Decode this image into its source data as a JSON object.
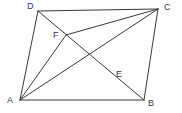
{
  "figure": {
    "background_color": "#fdfdfd",
    "stroke_color": "#3a3a3a",
    "stroke_width": 1,
    "width": 182,
    "height": 113,
    "labels": {
      "A": "A",
      "B": "B",
      "C": "C",
      "D": "D",
      "E": "E",
      "F": "F"
    },
    "points": {
      "A": {
        "x": 20,
        "y": 100
      },
      "B": {
        "x": 144,
        "y": 100
      },
      "C": {
        "x": 158,
        "y": 9
      },
      "D": {
        "x": 38,
        "y": 11
      },
      "E": {
        "x": 112,
        "y": 76
      },
      "F": {
        "x": 66,
        "y": 35
      }
    },
    "label_positions": {
      "A": {
        "x": 7,
        "y": 96
      },
      "B": {
        "x": 148,
        "y": 99
      },
      "C": {
        "x": 164,
        "y": 3
      },
      "D": {
        "x": 27,
        "y": 2
      },
      "E": {
        "x": 116,
        "y": 70
      },
      "F": {
        "x": 53,
        "y": 31
      }
    },
    "segments": [
      {
        "name": "side-AB",
        "from": "A",
        "to": "B"
      },
      {
        "name": "side-BC",
        "from": "B",
        "to": "C"
      },
      {
        "name": "side-CD",
        "from": "C",
        "to": "D"
      },
      {
        "name": "side-DA",
        "from": "D",
        "to": "A"
      },
      {
        "name": "diagonal-DB-through-F-and-E",
        "from": "D",
        "to": "B"
      },
      {
        "name": "diagonal-AC-through-E",
        "from": "A",
        "to": "C"
      },
      {
        "name": "cevian-AF",
        "from": "A",
        "to": "F"
      },
      {
        "name": "cevian-FC",
        "from": "F",
        "to": "C"
      }
    ]
  }
}
